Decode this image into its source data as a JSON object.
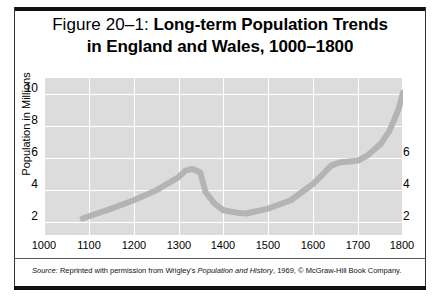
{
  "figure": {
    "title_prefix": "Figure 20–1:",
    "title_main_line1": "Long-term Population Trends",
    "title_line2": "in England and Wales, 1000–1800",
    "source_label": "Source:",
    "source_text_1": " Reprinted with permission from Wrigley's ",
    "source_work": "Population and History",
    "source_text_2": ", 1969, © McGraw-Hill Book Company.",
    "colors": {
      "plot_background": "#dcdcdc",
      "gridline": "#ffffff",
      "curve": "#b4b4b4",
      "border": "#111111",
      "text": "#000000"
    }
  },
  "chart_data": {
    "type": "line",
    "title": "Figure 20–1: Long-term Population Trends in England and Wales, 1000–1800",
    "xlabel": "",
    "ylabel": "Population in Millions",
    "xlim": [
      1000,
      1800
    ],
    "ylim": [
      1,
      10.5
    ],
    "grid": true,
    "legend": "none",
    "x_ticks": [
      1000,
      1100,
      1200,
      1300,
      1400,
      1500,
      1600,
      1700,
      1800
    ],
    "y_ticks_left": [
      2,
      4,
      6,
      8,
      10
    ],
    "y_ticks_right": [
      2,
      4,
      6
    ],
    "series": [
      {
        "name": "Population of England and Wales",
        "x": [
          1086,
          1150,
          1200,
          1250,
          1300,
          1315,
          1330,
          1348,
          1360,
          1380,
          1400,
          1430,
          1450,
          1500,
          1550,
          1600,
          1640,
          1660,
          1680,
          1700,
          1720,
          1750,
          1770,
          1790,
          1800
        ],
        "values": [
          2.0,
          2.6,
          3.1,
          3.7,
          4.5,
          4.9,
          5.0,
          4.8,
          3.6,
          2.9,
          2.5,
          2.35,
          2.3,
          2.6,
          3.1,
          4.1,
          5.2,
          5.4,
          5.45,
          5.5,
          5.8,
          6.5,
          7.3,
          8.6,
          9.6
        ]
      }
    ]
  }
}
